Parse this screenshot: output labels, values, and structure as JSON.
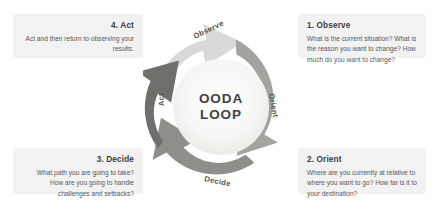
{
  "diagram": {
    "title": "OODA Loop",
    "center": {
      "line1": "OODA",
      "line2": "LOOP"
    },
    "colors": {
      "background": "#ffffff",
      "card_background": "#f2f2f2",
      "observe_arc": "#d9d9d7",
      "orient_arc": "#a3a39f",
      "decide_arc": "#8e8e8a",
      "act_arc": "#6f6f6c",
      "inner_circle": "#f0f0ee",
      "title_text": "#3a3a3a",
      "body_text": "#58585a",
      "center_text": "#414141",
      "arc_label_text": "#54544f"
    },
    "arcs": [
      {
        "key": "observe",
        "label": "Observe"
      },
      {
        "key": "orient",
        "label": "Orient"
      },
      {
        "key": "decide",
        "label": "Decide"
      },
      {
        "key": "act",
        "label": "Act"
      }
    ],
    "cards": [
      {
        "key": "act",
        "title": "4. Act",
        "body": "Act and then return to observing your results.",
        "align": "right"
      },
      {
        "key": "observe",
        "title": "1. Observe",
        "body": "What is the current situation? What is the reason you want to change? How much do you want to change?",
        "align": "left"
      },
      {
        "key": "decide",
        "title": "3. Decide",
        "body": "What path you are going to take? How are you going to handle challenges and setbacks?",
        "align": "right"
      },
      {
        "key": "orient",
        "title": "2. Orient",
        "body": "Where are you currently at relative to where you want to go? How far is it to your destination?",
        "align": "left"
      }
    ]
  }
}
